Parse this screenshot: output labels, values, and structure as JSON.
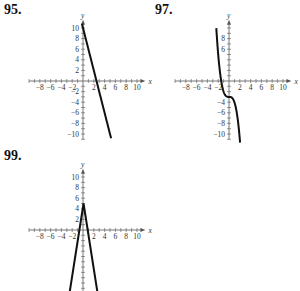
{
  "problems": [
    {
      "label": "95.",
      "x": 4,
      "y": 2
    },
    {
      "label": "97.",
      "x": 155,
      "y": 2
    },
    {
      "label": "99.",
      "x": 4,
      "y": 148
    }
  ],
  "chart_data": [
    {
      "type": "line",
      "title": "95.",
      "xlabel": "x",
      "ylabel": "y",
      "xlim": [
        -10,
        11
      ],
      "ylim": [
        -11,
        11
      ],
      "x_ticks": [
        -8,
        -6,
        -4,
        -2,
        2,
        4,
        6,
        8,
        10
      ],
      "y_ticks": [
        10,
        8,
        6,
        4,
        2,
        -2,
        -4,
        -6,
        -8,
        -10
      ],
      "grid": false,
      "series": [
        {
          "name": "y = -4x + 10",
          "x": [
            -0.2,
            5.2
          ],
          "y": [
            10.8,
            -10.8
          ]
        }
      ],
      "origin_px": [
        83,
        81
      ],
      "scale_px": [
        5.4,
        5.3
      ]
    },
    {
      "type": "line",
      "title": "97.",
      "xlabel": "x",
      "ylabel": "y",
      "xlim": [
        -10,
        11
      ],
      "ylim": [
        -11,
        11
      ],
      "x_ticks": [
        -8,
        -6,
        -4,
        -2,
        2,
        4,
        6,
        8,
        10
      ],
      "y_ticks": [
        8,
        6,
        -4,
        -6,
        -8,
        -10
      ],
      "grid": false,
      "series": [
        {
          "name": "y = -x^3 - 3",
          "x": [
            -2.35,
            -2,
            -1.5,
            -1,
            -0.5,
            0,
            0.5,
            1,
            1.5,
            2,
            2.05
          ],
          "y": [
            10,
            5,
            0.4,
            -2,
            -2.9,
            -3,
            -3.1,
            -4,
            -6.4,
            -11,
            -11.6
          ]
        }
      ],
      "origin_px": [
        229,
        81
      ],
      "scale_px": [
        5.4,
        5.3
      ]
    },
    {
      "type": "line",
      "title": "99.",
      "xlabel": "x",
      "ylabel": "y",
      "xlim": [
        -10,
        11
      ],
      "ylim": [
        -11.5,
        11
      ],
      "x_ticks": [
        -8,
        -6,
        -4,
        -2,
        2,
        4,
        6,
        8,
        10
      ],
      "y_ticks": [
        10,
        8,
        6,
        4,
        2
      ],
      "grid": false,
      "series": [
        {
          "name": "y = -6.5|x - 0.1| + 5",
          "x": [
            -2.45,
            0.1,
            2.65
          ],
          "y": [
            -11.6,
            5,
            -11.6
          ]
        }
      ],
      "origin_px": [
        83,
        230
      ],
      "scale_px": [
        5.4,
        5.3
      ]
    }
  ]
}
